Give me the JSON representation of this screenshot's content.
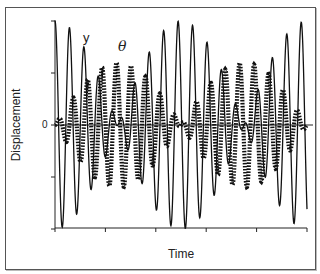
{
  "chart_data": {
    "type": "line",
    "title": "",
    "xlabel": "Time",
    "ylabel": "Displacement",
    "y_tick_labels": [
      "0"
    ],
    "ylim": [
      -1,
      1
    ],
    "xlim": [
      0,
      1
    ],
    "x_ticks": [
      0,
      0.2,
      0.4,
      0.6,
      0.8,
      1.0
    ],
    "y_ticks": [
      -1,
      -0.5,
      0,
      0.5,
      1
    ],
    "grid": false,
    "legend": "inline annotations",
    "annotations": [
      "y",
      "θ"
    ],
    "series": [
      {
        "name": "y",
        "style": "thin solid line",
        "model": "y = A·cos(2π·f·t)·cos(2π·b·t)",
        "amplitude": 1.0,
        "carrier_cycles": 17.4,
        "beat_cycles": 1.0,
        "envelope_maxima_t": [
          0,
          0.5,
          1.0
        ],
        "envelope_minima_t": [
          0.25,
          0.75
        ]
      },
      {
        "name": "θ",
        "style": "thick dotted line",
        "model": "θ = A·sin(2π·f·t)·sin(2π·b·t)",
        "amplitude": 0.6,
        "carrier_cycles": 17.4,
        "beat_cycles": 1.0,
        "envelope_maxima_t": [
          0.25,
          0.75
        ],
        "envelope_minima_t": [
          0,
          0.5,
          1.0
        ]
      }
    ]
  },
  "labels": {
    "xlabel": "Time",
    "ylabel": "Displacement",
    "zero": "0",
    "series_y": "y",
    "series_theta": "θ"
  },
  "plot_area": {
    "x0": 55,
    "x1": 307,
    "y_top": 20,
    "y_zero": 125,
    "y_bottom": 228
  }
}
